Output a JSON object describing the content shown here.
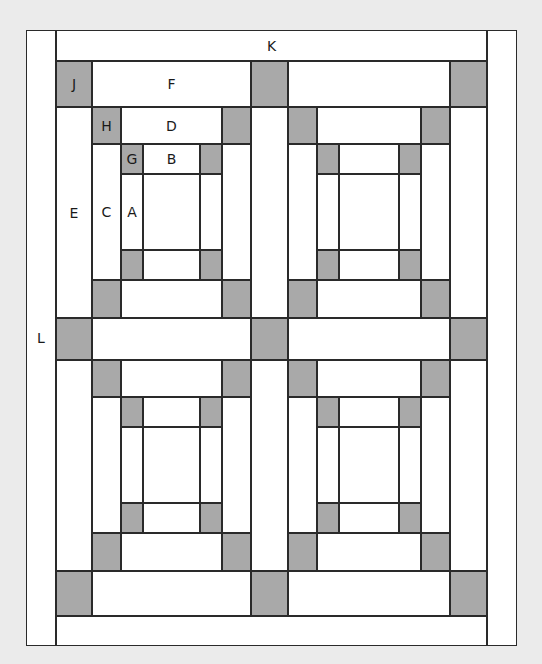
{
  "diagram": {
    "colors": {
      "background": "#ebebeb",
      "light_piece": "#ffffff",
      "dark_piece": "#a9a9a9",
      "seam": "#2a2a2a"
    },
    "labels": {
      "K": "K",
      "L": "L",
      "J": "J",
      "F": "F",
      "E": "E",
      "H": "H",
      "D": "D",
      "C": "C",
      "G": "G",
      "B": "B",
      "A": "A"
    },
    "layout": {
      "borders": {
        "left_L": [
          26,
          30,
          30,
          616
        ],
        "top_K": [
          56,
          30,
          431,
          31
        ],
        "right": [
          487,
          30,
          30,
          616
        ],
        "bottom": [
          56,
          616,
          431,
          30
        ]
      },
      "sash_cols": [
        [
          56,
          36
        ],
        [
          92,
          159
        ],
        [
          251,
          37
        ],
        [
          288,
          162
        ],
        [
          450,
          37
        ]
      ],
      "sash_rows": [
        [
          61,
          46
        ],
        [
          107,
          211
        ],
        [
          318,
          42
        ],
        [
          360,
          211
        ],
        [
          571,
          45
        ]
      ],
      "block_grid": "2x2",
      "block_count": 4
    }
  }
}
